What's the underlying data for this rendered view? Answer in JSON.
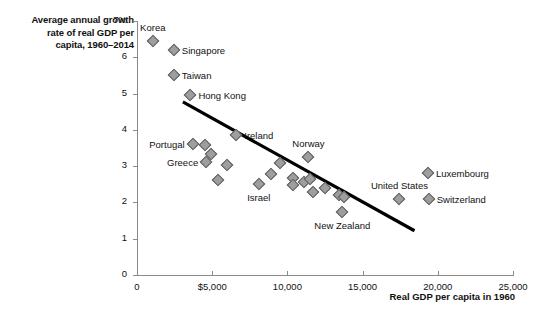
{
  "chart_data": {
    "type": "scatter",
    "title": "Average annual growth rate of real GDP per capita, 1960–2014",
    "title_lines": [
      "Average annual growth",
      "rate of real GDP per",
      "capita, 1960–2014"
    ],
    "xlabel": "Real GDP per capita in 1960",
    "ylabel": "Average annual growth rate of real GDP per capita, 1960–2014",
    "xlim": [
      0,
      25000
    ],
    "ylim": [
      0,
      7
    ],
    "grid": false,
    "legend": "none",
    "xticks": [
      0,
      5000,
      10000,
      15000,
      20000,
      25000
    ],
    "xtick_labels": [
      "0",
      "$5,000",
      "10,000",
      "15,000",
      "20,000",
      "25,000"
    ],
    "yticks": [
      0,
      1,
      2,
      3,
      4,
      5,
      6,
      7
    ],
    "ytick_labels": [
      "0",
      "1",
      "2",
      "3",
      "4",
      "5",
      "6",
      "7%"
    ],
    "marker_color": "#9e9e9e",
    "marker_edge_color": "#5c5c5c",
    "trendline": {
      "type": "linear-fit",
      "color": "#000000",
      "x_start": 3050,
      "y_start": 4.77,
      "x_end": 18450,
      "y_end": 1.22
    },
    "points": [
      {
        "label": "Korea",
        "x": 1050,
        "y": 6.45,
        "label_pos": "above"
      },
      {
        "label": "Singapore",
        "x": 2450,
        "y": 6.2,
        "label_pos": "right"
      },
      {
        "label": "Taiwan",
        "x": 2450,
        "y": 5.52,
        "label_pos": "right"
      },
      {
        "label": "Hong Kong",
        "x": 3550,
        "y": 4.97,
        "label_pos": "right"
      },
      {
        "label": "Ireland",
        "x": 6600,
        "y": 3.85,
        "label_pos": "right"
      },
      {
        "label": "Portugal",
        "x": 3700,
        "y": 3.6,
        "label_pos": "left"
      },
      {
        "label": "",
        "x": 4500,
        "y": 3.57,
        "label_pos": "none"
      },
      {
        "label": "",
        "x": 4950,
        "y": 3.33,
        "label_pos": "none"
      },
      {
        "label": "Greece",
        "x": 4600,
        "y": 3.12,
        "label_pos": "left"
      },
      {
        "label": "",
        "x": 6000,
        "y": 3.02,
        "label_pos": "none"
      },
      {
        "label": "",
        "x": 5400,
        "y": 2.62,
        "label_pos": "none"
      },
      {
        "label": "Israel",
        "x": 8100,
        "y": 2.5,
        "label_pos": "below"
      },
      {
        "label": "",
        "x": 8900,
        "y": 2.77,
        "label_pos": "none"
      },
      {
        "label": "",
        "x": 9500,
        "y": 3.08,
        "label_pos": "none"
      },
      {
        "label": "",
        "x": 10400,
        "y": 2.67,
        "label_pos": "none"
      },
      {
        "label": "",
        "x": 10400,
        "y": 2.48,
        "label_pos": "none"
      },
      {
        "label": "",
        "x": 11100,
        "y": 2.55,
        "label_pos": "none"
      },
      {
        "label": "Norway",
        "x": 11400,
        "y": 3.24,
        "label_pos": "above"
      },
      {
        "label": "",
        "x": 11500,
        "y": 2.65,
        "label_pos": "none"
      },
      {
        "label": "",
        "x": 11700,
        "y": 2.28,
        "label_pos": "none"
      },
      {
        "label": "",
        "x": 12500,
        "y": 2.4,
        "label_pos": "none"
      },
      {
        "label": "",
        "x": 13400,
        "y": 2.2,
        "label_pos": "none"
      },
      {
        "label": "",
        "x": 13750,
        "y": 2.15,
        "label_pos": "none"
      },
      {
        "label": "New Zealand",
        "x": 13650,
        "y": 1.73,
        "label_pos": "below"
      },
      {
        "label": "United States",
        "x": 17450,
        "y": 2.1,
        "label_pos": "above"
      },
      {
        "label": "Luxembourg",
        "x": 19350,
        "y": 2.82,
        "label_pos": "right"
      },
      {
        "label": "Switzerland",
        "x": 19400,
        "y": 2.1,
        "label_pos": "right"
      }
    ]
  }
}
